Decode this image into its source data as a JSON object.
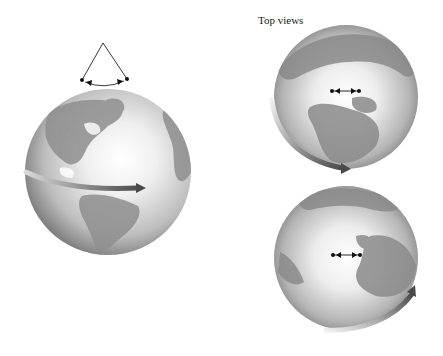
{
  "figure": {
    "top_views_label": "Top views",
    "panels": [
      {
        "id": "side-view",
        "description": "Globe viewed from the side with an eastward equatorial rotation arrow and a Foucault-style pendulum swing cone above the north pole"
      },
      {
        "id": "top-view-1",
        "description": "Globe viewed from above the north pole with pendulum swing line and counter-clockwise rotation arrow at lower left"
      },
      {
        "id": "top-view-2",
        "description": "Globe viewed from above the north pole, rotated later in time, with pendulum swing line and rotation arrow at lower right"
      }
    ]
  },
  "colors": {
    "globe_light": "#f4f4f4",
    "globe_mid": "#b8b8b8",
    "globe_dark": "#6e6e6e",
    "land": "#8c8c8c",
    "arrow_dark": "#4a4a4a",
    "line": "#222222"
  }
}
